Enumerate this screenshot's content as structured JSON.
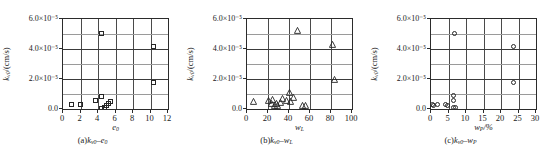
{
  "figure": {
    "panel_count": 3,
    "marker_color": "#262626",
    "grid_color": "#9a9a9a",
    "axis_color": "#2b2b2b"
  },
  "chart_data": [
    {
      "id": "panel-a",
      "type": "scatter",
      "title": "",
      "caption": "(a)kv0-e0",
      "xlabel": "e0",
      "ylabel": "kv0/(cm/s)",
      "marker": "square",
      "xlim": [
        0,
        12
      ],
      "ylim": [
        0,
        6e-05
      ],
      "xticks": [
        "0",
        "2",
        "4",
        "6",
        "8",
        "10",
        "12"
      ],
      "xtick_values": [
        0,
        2,
        4,
        6,
        8,
        10,
        12
      ],
      "yticks": [
        "0.0",
        "2.0×10⁻⁵",
        "4.0×10⁻⁵",
        "6.0×10⁻⁵"
      ],
      "ytick_values": [
        0,
        2e-05,
        4e-05,
        6e-05
      ],
      "grid": true,
      "legend": "none",
      "points": [
        {
          "x": 0.95,
          "y": 3e-06
        },
        {
          "x": 1.95,
          "y": 3.2e-06
        },
        {
          "x": 3.75,
          "y": 5.5e-06
        },
        {
          "x": 4.35,
          "y": 8.5e-06
        },
        {
          "x": 4.4,
          "y": 5.05e-05
        },
        {
          "x": 4.45,
          "y": 5e-07
        },
        {
          "x": 4.7,
          "y": 1.2e-06
        },
        {
          "x": 4.95,
          "y": 2.2e-06
        },
        {
          "x": 5.25,
          "y": 3.5e-06
        },
        {
          "x": 5.45,
          "y": 4.8e-06
        },
        {
          "x": 10.35,
          "y": 4.15e-05
        },
        {
          "x": 10.35,
          "y": 1.8e-05
        }
      ]
    },
    {
      "id": "panel-b",
      "type": "scatter",
      "title": "",
      "caption": "(b)kv0-wL",
      "xlabel": "wL",
      "ylabel": "kv0/(cm/s)",
      "marker": "triangle",
      "xlim": [
        0,
        100
      ],
      "ylim": [
        0,
        6e-05
      ],
      "xticks": [
        "0",
        "20",
        "40",
        "60",
        "80",
        "100"
      ],
      "xtick_values": [
        0,
        20,
        40,
        60,
        80,
        100
      ],
      "yticks": [
        "0.0",
        "2.0×10⁻⁵",
        "4.0×10⁻⁵",
        "6.0×10⁻⁵"
      ],
      "ytick_values": [
        0,
        2e-05,
        4e-05,
        6e-05
      ],
      "grid": true,
      "legend": "none",
      "points": [
        {
          "x": 8.5,
          "y": 3.2e-06
        },
        {
          "x": 23.0,
          "y": 4.2e-06
        },
        {
          "x": 25.5,
          "y": 2e-06
        },
        {
          "x": 27.0,
          "y": 4.8e-06
        },
        {
          "x": 28.5,
          "y": 1e-06
        },
        {
          "x": 30.0,
          "y": 2.2e-06
        },
        {
          "x": 31.5,
          "y": 8e-07
        },
        {
          "x": 34.0,
          "y": 3e-06
        },
        {
          "x": 36.5,
          "y": 5.5e-06
        },
        {
          "x": 39.5,
          "y": 4.2e-06
        },
        {
          "x": 42.5,
          "y": 9.5e-06
        },
        {
          "x": 44.0,
          "y": 3.5e-06
        },
        {
          "x": 46.5,
          "y": 6.2e-06
        },
        {
          "x": 50.5,
          "y": 5.05e-05
        },
        {
          "x": 55.0,
          "y": 6e-07
        },
        {
          "x": 58.0,
          "y": 6e-07
        },
        {
          "x": 84.0,
          "y": 4.15e-05
        },
        {
          "x": 85.5,
          "y": 1.8e-05
        }
      ]
    },
    {
      "id": "panel-c",
      "type": "scatter",
      "title": "",
      "caption": "(c)kv0-wP",
      "xlabel": "wP/%",
      "ylabel": "kv0/(cm/s)",
      "marker": "circle",
      "xlim": [
        0,
        30
      ],
      "ylim": [
        0,
        6e-05
      ],
      "xticks": [
        "0",
        "5",
        "10",
        "15",
        "20",
        "25",
        "30"
      ],
      "xtick_values": [
        0,
        5,
        10,
        15,
        20,
        25,
        30
      ],
      "yticks": [
        "0.0",
        "2.0×10⁻⁵",
        "4.0×10⁻⁵",
        "6.0×10⁻⁵"
      ],
      "ytick_values": [
        0,
        2e-05,
        4e-05,
        6e-05
      ],
      "grid": true,
      "legend": "none",
      "points": [
        {
          "x": 0.4,
          "y": 3e-06
        },
        {
          "x": 0.8,
          "y": 2.2e-06
        },
        {
          "x": 1.9,
          "y": 3.3e-06
        },
        {
          "x": 4.2,
          "y": 3e-06
        },
        {
          "x": 4.8,
          "y": 2.2e-06
        },
        {
          "x": 6.3,
          "y": 8.8e-06
        },
        {
          "x": 6.4,
          "y": 5.5e-06
        },
        {
          "x": 6.3,
          "y": 1.2e-06
        },
        {
          "x": 6.9,
          "y": 1e-06
        },
        {
          "x": 6.6,
          "y": 5.05e-05
        },
        {
          "x": 23.6,
          "y": 4.15e-05
        },
        {
          "x": 23.6,
          "y": 1.8e-05
        }
      ]
    }
  ]
}
